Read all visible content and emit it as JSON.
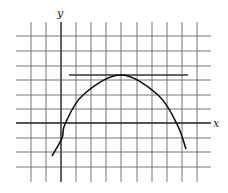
{
  "figure": {
    "type": "function-graph",
    "axes": {
      "x_label": "x",
      "y_label": "y"
    },
    "grid": {
      "vertical_lines_px": [
        31,
        46,
        61,
        76,
        91,
        106,
        121,
        137,
        152,
        167,
        182,
        197
      ],
      "horizontal_lines_px": [
        36,
        51,
        66,
        80,
        95,
        109,
        123,
        138,
        152,
        167
      ],
      "x_axis_px": 123,
      "y_axis_px": 61,
      "color": "#555555"
    },
    "curve": {
      "shape": "parabola-like, concave down",
      "vertex_grid": [
        4,
        3.3
      ],
      "points_px": [
        [
          52,
          156
        ],
        [
          62,
          138
        ],
        [
          65,
          124
        ],
        [
          83,
          95
        ],
        [
          121,
          75
        ],
        [
          158,
          95
        ],
        [
          177,
          124
        ],
        [
          186,
          149
        ]
      ],
      "color": "#111111"
    },
    "tangent_line": {
      "orientation": "horizontal",
      "y_px": 75,
      "x_start_px": 69,
      "x_end_px": 188,
      "color": "#333333"
    }
  }
}
